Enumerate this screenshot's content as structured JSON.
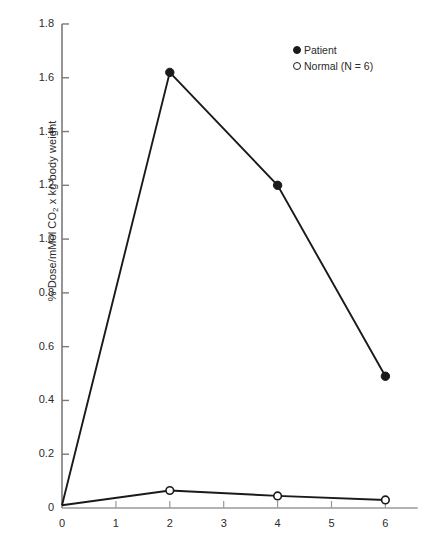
{
  "chart_data": {
    "type": "line",
    "title": "",
    "subtitle": "",
    "xlabel": "",
    "ylabel": "% Dose/mMol CO2 x kg body weight",
    "ylabel_parts": {
      "pre": "% Dose/mMol CO",
      "sub": "2",
      "post": " x kg body weight"
    },
    "xlim": [
      0,
      6.6
    ],
    "ylim": [
      0,
      1.8
    ],
    "grid": false,
    "x_ticks": [
      "0",
      "1",
      "2",
      "3",
      "4",
      "5",
      "6"
    ],
    "x_tick_values": [
      0,
      1,
      2,
      3,
      4,
      5,
      6
    ],
    "y_ticks": [
      "0",
      "0.2",
      "0.4",
      "0.6",
      "0.8",
      "1.0",
      "1.2",
      "1.4",
      "1.6",
      "1.8"
    ],
    "y_tick_values": [
      0,
      0.2,
      0.4,
      0.6,
      0.8,
      1.0,
      1.2,
      1.4,
      1.6,
      1.8
    ],
    "legend_position": "top-right",
    "series": [
      {
        "name": "Patient",
        "marker": "filled-circle",
        "color": "#1a1a1a",
        "x": [
          0,
          2,
          4,
          6
        ],
        "values": [
          0.01,
          1.62,
          1.2,
          0.49
        ]
      },
      {
        "name": "Normal (N = 6)",
        "marker": "open-circle",
        "color": "#1a1a1a",
        "x": [
          0,
          2,
          4,
          6
        ],
        "values": [
          0.01,
          0.065,
          0.045,
          0.03
        ]
      }
    ]
  },
  "legend": {
    "items": [
      {
        "label": "Patient",
        "marker": "filled-circle-marker"
      },
      {
        "label": "Normal (N = 6)",
        "marker": "open-circle-marker"
      }
    ]
  },
  "axes": {
    "y_title": "% Dose/mMol CO2 x kg body weight",
    "x_title": ""
  }
}
